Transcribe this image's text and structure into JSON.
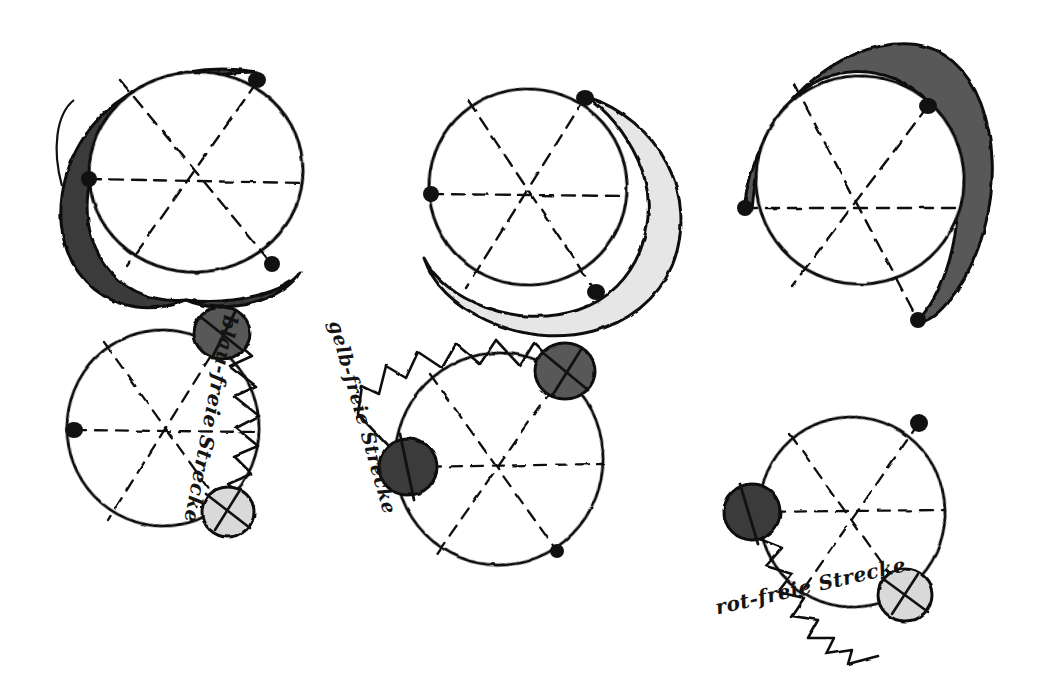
{
  "document": {
    "kind": "hand-drawn-sketch",
    "background_color": "#ffffff",
    "ink_color": "#111111",
    "width": 1049,
    "height": 688
  },
  "palette": {
    "ink": "#111111",
    "dark_gray": "#3b3b3b",
    "medium_gray": "#585858",
    "light_gray": "#d9d9d9",
    "pale_gray": "#e6e6e6",
    "paper": "#ffffff"
  },
  "labels": {
    "blau": "blau-freie Strecke",
    "gelb": "gelb-freie Strecke",
    "rot": "rot-freie Strecke"
  },
  "figures": [
    {
      "id": "top-left",
      "row": "top",
      "column": "left",
      "center": [
        196,
        172
      ],
      "radius": 107,
      "crescent": {
        "present": true,
        "fill": "#3b3b3b",
        "side": "left",
        "description": "thick dark crescent hugging the left and bottom outside of the circle"
      },
      "spokes": 3,
      "spoke_style": "dashed",
      "vertex_dots": [
        {
          "name": "dot-top-right",
          "position": [
            257,
            82
          ]
        },
        {
          "name": "dot-left",
          "position": [
            88,
            179
          ]
        },
        {
          "name": "dot-bottom-right",
          "position": [
            272,
            264
          ]
        }
      ],
      "discs": [],
      "zigzag": {
        "present": false
      },
      "label": null
    },
    {
      "id": "top-middle",
      "row": "top",
      "column": "middle",
      "center": [
        528,
        187
      ],
      "radius": 99,
      "crescent": {
        "present": true,
        "fill": "#e6e6e6",
        "side": "right-bottom",
        "description": "pale crescent sweeping around the right and bottom outside of the circle"
      },
      "spokes": 3,
      "spoke_style": "dashed",
      "vertex_dots": [
        {
          "name": "dot-top-right",
          "position": [
            585,
            98
          ]
        },
        {
          "name": "dot-left",
          "position": [
            430,
            194
          ]
        },
        {
          "name": "dot-bottom-right",
          "position": [
            596,
            292
          ]
        }
      ],
      "discs": [],
      "zigzag": {
        "present": false
      },
      "label": null
    },
    {
      "id": "top-right",
      "row": "top",
      "column": "right",
      "center": [
        863,
        178
      ],
      "radius": 104,
      "crescent": {
        "present": true,
        "fill": "#585858",
        "side": "top-right",
        "description": "medium-gray crescent riding over the top and right outside of the circle"
      },
      "spokes": 3,
      "spoke_style": "dashed",
      "vertex_dots": [
        {
          "name": "dot-top-right",
          "position": [
            928,
            106
          ]
        },
        {
          "name": "dot-left",
          "position": [
            744,
            208
          ]
        },
        {
          "name": "dot-bottom-right",
          "position": [
            918,
            320
          ]
        }
      ],
      "discs": [],
      "zigzag": {
        "present": false
      },
      "label": null
    },
    {
      "id": "bottom-left",
      "row": "bottom",
      "column": "left",
      "center": [
        163,
        428
      ],
      "radius": 96,
      "crescent": {
        "present": false
      },
      "spokes": 3,
      "spoke_style": "dashed",
      "vertex_dots": [
        {
          "name": "dot-left",
          "position": [
            74,
            430
          ]
        }
      ],
      "discs": [
        {
          "name": "disc-dark",
          "position": [
            222,
            333
          ],
          "radius": 28,
          "fill": "#585858",
          "marker": "x-cross"
        },
        {
          "name": "disc-light",
          "position": [
            228,
            512
          ],
          "radius": 26,
          "fill": "#d9d9d9",
          "marker": "x-cross"
        }
      ],
      "zigzag": {
        "present": true,
        "description": "saw-tooth zigzag along the right arc between the dark disc and the light disc",
        "teeth": 9
      },
      "label": "blau"
    },
    {
      "id": "bottom-middle",
      "row": "bottom",
      "column": "middle",
      "center": [
        499,
        459
      ],
      "radius": 104,
      "crescent": {
        "present": false
      },
      "spokes": 3,
      "spoke_style": "dashed",
      "vertex_dots": [
        {
          "name": "dot-bottom-right",
          "position": [
            557,
            551
          ]
        }
      ],
      "discs": [
        {
          "name": "disc-dark-upper",
          "position": [
            565,
            371
          ],
          "radius": 29,
          "fill": "#585858",
          "marker": "x-cross"
        },
        {
          "name": "disc-dark-left",
          "position": [
            408,
            467
          ],
          "radius": 28,
          "fill": "#3b3b3b",
          "marker": "x-cross"
        }
      ],
      "zigzag": {
        "present": true,
        "description": "saw-tooth zigzag along the upper-left arc between the two dark discs",
        "teeth": 8
      },
      "label": "gelb"
    },
    {
      "id": "bottom-right",
      "row": "bottom",
      "column": "right",
      "center": [
        852,
        512
      ],
      "radius": 93,
      "crescent": {
        "present": false
      },
      "spokes": 3,
      "spoke_style": "dashed",
      "vertex_dots": [
        {
          "name": "dot-top-right",
          "position": [
            919,
            423
          ]
        }
      ],
      "discs": [
        {
          "name": "disc-dark",
          "position": [
            752,
            512
          ],
          "radius": 28,
          "fill": "#3b3b3b",
          "marker": "x-cross"
        },
        {
          "name": "disc-light",
          "position": [
            905,
            595
          ],
          "radius": 27,
          "fill": "#d9d9d9",
          "marker": "x-cross"
        }
      ],
      "zigzag": {
        "present": true,
        "description": "saw-tooth zigzag along the bottom-left arc between the dark disc and the light disc",
        "teeth": 9
      },
      "label": "rot"
    }
  ]
}
